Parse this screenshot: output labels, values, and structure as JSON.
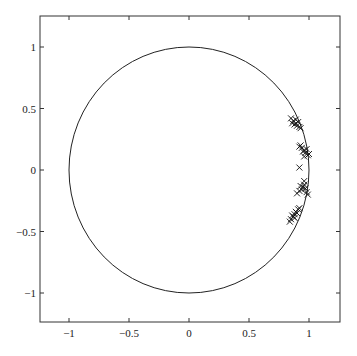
{
  "chart_data": {
    "type": "scatter",
    "title": "",
    "xlabel": "",
    "ylabel": "",
    "xlim": [
      -1.25,
      1.25
    ],
    "ylim": [
      -1.25,
      1.25
    ],
    "grid": false,
    "legend": null,
    "aspect": "equal",
    "x_ticks": [
      -1,
      -0.5,
      0,
      0.5,
      1
    ],
    "x_tick_labels": [
      "−1",
      "−0.5",
      "0",
      "0.5",
      "1"
    ],
    "y_ticks": [
      1,
      0.5,
      0,
      -0.5,
      -1
    ],
    "y_tick_labels": [
      "1",
      "0.5",
      "0",
      "−0.5",
      "−1"
    ],
    "annotations": [
      {
        "type": "circle",
        "center": [
          0,
          0
        ],
        "radius": 1,
        "description": "unit circle"
      }
    ],
    "series": [
      {
        "name": "poles",
        "marker": "x",
        "clusters": [
          {
            "center": [
              0.89,
              0.38
            ],
            "spread": 0.03,
            "count": 30
          },
          {
            "center": [
              0.96,
              0.16
            ],
            "spread": 0.03,
            "count": 30
          },
          {
            "center": [
              0.92,
              0.02
            ],
            "spread": 0.0,
            "count": 1
          },
          {
            "center": [
              0.95,
              -0.14
            ],
            "spread": 0.03,
            "count": 30
          },
          {
            "center": [
              0.88,
              -0.36
            ],
            "spread": 0.03,
            "count": 30
          }
        ],
        "points": [
          [
            0.89,
            0.38
          ],
          [
            0.87,
            0.4
          ],
          [
            0.9,
            0.36
          ],
          [
            0.88,
            0.37
          ],
          [
            0.91,
            0.39
          ],
          [
            0.86,
            0.38
          ],
          [
            0.89,
            0.41
          ],
          [
            0.92,
            0.35
          ],
          [
            0.85,
            0.42
          ],
          [
            0.93,
            0.34
          ],
          [
            0.96,
            0.16
          ],
          [
            0.94,
            0.18
          ],
          [
            0.97,
            0.14
          ],
          [
            0.95,
            0.15
          ],
          [
            0.98,
            0.17
          ],
          [
            0.93,
            0.2
          ],
          [
            0.99,
            0.12
          ],
          [
            0.92,
            0.19
          ],
          [
            1.0,
            0.13
          ],
          [
            0.96,
            0.11
          ],
          [
            0.92,
            0.02
          ],
          [
            0.95,
            -0.14
          ],
          [
            0.96,
            -0.12
          ],
          [
            0.94,
            -0.16
          ],
          [
            0.97,
            -0.15
          ],
          [
            0.93,
            -0.13
          ],
          [
            0.98,
            -0.18
          ],
          [
            0.92,
            -0.17
          ],
          [
            0.96,
            -0.09
          ],
          [
            0.9,
            -0.19
          ],
          [
            0.99,
            -0.2
          ],
          [
            0.88,
            -0.36
          ],
          [
            0.87,
            -0.38
          ],
          [
            0.89,
            -0.34
          ],
          [
            0.86,
            -0.37
          ],
          [
            0.9,
            -0.35
          ],
          [
            0.85,
            -0.4
          ],
          [
            0.91,
            -0.32
          ],
          [
            0.88,
            -0.39
          ],
          [
            0.92,
            -0.31
          ],
          [
            0.84,
            -0.42
          ]
        ]
      }
    ]
  },
  "colors": {
    "axis": "#333333",
    "curve": "#222222",
    "marker": "#111111",
    "background": "#ffffff"
  }
}
